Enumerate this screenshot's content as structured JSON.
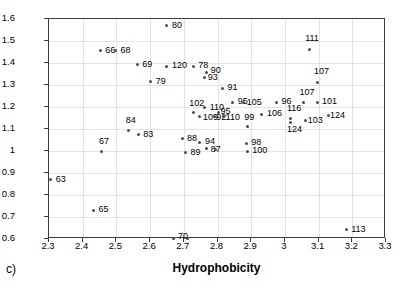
{
  "caption": "c)",
  "chart_data": {
    "type": "scatter",
    "title": "",
    "xlabel": "Hydrophobicity",
    "ylabel": "Silanol Activity at pH 7",
    "xlim": [
      2.3,
      3.3
    ],
    "ylim": [
      0.6,
      1.6
    ],
    "xticks": [
      "2.3",
      "2.4",
      "2.5",
      "2.6",
      "2.7",
      "2.8",
      "2.9",
      "3",
      "3.1",
      "3.2",
      "3.3"
    ],
    "yticks": [
      "0.6",
      "0.7",
      "0.8",
      "0.9",
      "1",
      "1.1",
      "1.2",
      "1.3",
      "1.4",
      "1.5",
      "1.6"
    ],
    "grid": true,
    "legend": "none",
    "marker": "small-dot",
    "points": [
      {
        "label": "63",
        "x": 2.305,
        "y": 0.87,
        "lx": 5,
        "ly": -5
      },
      {
        "label": "65",
        "x": 2.432,
        "y": 0.73,
        "lx": 5,
        "ly": -5
      },
      {
        "label": "66",
        "x": 2.452,
        "y": 1.455,
        "lx": 5,
        "ly": -5
      },
      {
        "label": "68",
        "x": 2.497,
        "y": 1.455,
        "lx": 5,
        "ly": -5
      },
      {
        "label": "67",
        "x": 2.457,
        "y": 1.0,
        "lx": -3,
        "ly": -14
      },
      {
        "label": "69",
        "x": 2.562,
        "y": 1.392,
        "lx": 5,
        "ly": -5
      },
      {
        "label": "79",
        "x": 2.602,
        "y": 1.315,
        "lx": 5,
        "ly": -5
      },
      {
        "label": "84",
        "x": 2.537,
        "y": 1.093,
        "lx": -3,
        "ly": -15
      },
      {
        "label": "83",
        "x": 2.565,
        "y": 1.073,
        "lx": 5,
        "ly": -5
      },
      {
        "label": "80",
        "x": 2.65,
        "y": 1.57,
        "lx": 5,
        "ly": -5
      },
      {
        "label": "120",
        "x": 2.65,
        "y": 1.385,
        "lx": 5,
        "ly": -5
      },
      {
        "label": "78",
        "x": 2.728,
        "y": 1.385,
        "lx": 5,
        "ly": -5
      },
      {
        "label": "70",
        "x": 2.668,
        "y": 0.602,
        "lx": 5,
        "ly": -7
      },
      {
        "label": "",
        "x": 2.712,
        "y": 0.602,
        "lx": 0,
        "ly": 0
      },
      {
        "label": "88",
        "x": 2.695,
        "y": 1.055,
        "lx": 5,
        "ly": -5
      },
      {
        "label": "89",
        "x": 2.705,
        "y": 0.993,
        "lx": 5,
        "ly": -5
      },
      {
        "label": "102",
        "x": 2.728,
        "y": 1.175,
        "lx": -4,
        "ly": -14
      },
      {
        "label": "109",
        "x": 2.748,
        "y": 1.155,
        "lx": 3,
        "ly": -4
      },
      {
        "label": "90",
        "x": 2.768,
        "y": 1.358,
        "lx": 4,
        "ly": -6
      },
      {
        "label": "93",
        "x": 2.762,
        "y": 1.335,
        "lx": 3,
        "ly": -4
      },
      {
        "label": "110",
        "x": 2.762,
        "y": 1.197,
        "lx": 5,
        "ly": -5
      },
      {
        "label": "94",
        "x": 2.748,
        "y": 1.04,
        "lx": 5,
        "ly": -5
      },
      {
        "label": "87",
        "x": 2.768,
        "y": 1.01,
        "lx": 4,
        "ly": -4
      },
      {
        "label": "",
        "x": 2.793,
        "y": 1.005,
        "lx": 0,
        "ly": 0
      },
      {
        "label": "92",
        "x": 2.79,
        "y": 1.155,
        "lx": 2,
        "ly": -4
      },
      {
        "label": "95",
        "x": 2.803,
        "y": 1.175,
        "lx": 2,
        "ly": -6
      },
      {
        "label": "110",
        "x": 2.818,
        "y": 1.155,
        "lx": 2,
        "ly": -4
      },
      {
        "label": "91",
        "x": 2.815,
        "y": 1.285,
        "lx": 5,
        "ly": -5
      },
      {
        "label": "95",
        "x": 2.845,
        "y": 1.222,
        "lx": 5,
        "ly": -5
      },
      {
        "label": "105",
        "x": 2.878,
        "y": 1.222,
        "lx": 3,
        "ly": -4
      },
      {
        "label": "99",
        "x": 2.888,
        "y": 1.11,
        "lx": -3,
        "ly": -14
      },
      {
        "label": "98",
        "x": 2.885,
        "y": 1.035,
        "lx": 5,
        "ly": -5
      },
      {
        "label": "100",
        "x": 2.888,
        "y": 0.998,
        "lx": 5,
        "ly": -5
      },
      {
        "label": "106",
        "x": 2.932,
        "y": 1.168,
        "lx": 5,
        "ly": -5
      },
      {
        "label": "96",
        "x": 2.975,
        "y": 1.222,
        "lx": 5,
        "ly": -5
      },
      {
        "label": "116",
        "x": 3.018,
        "y": 1.15,
        "lx": -4,
        "ly": -14
      },
      {
        "label": "124",
        "x": 3.018,
        "y": 1.128,
        "lx": -4,
        "ly": 2
      },
      {
        "label": "103",
        "x": 3.062,
        "y": 1.14,
        "lx": 2,
        "ly": -4
      },
      {
        "label": "107",
        "x": 3.055,
        "y": 1.222,
        "lx": -4,
        "ly": -14
      },
      {
        "label": "101",
        "x": 3.098,
        "y": 1.222,
        "lx": 4,
        "ly": -5
      },
      {
        "label": "124",
        "x": 3.128,
        "y": 1.16,
        "lx": 2,
        "ly": -5
      },
      {
        "label": "111",
        "x": 3.072,
        "y": 1.462,
        "lx": -4,
        "ly": -15
      },
      {
        "label": "107",
        "x": 3.098,
        "y": 1.312,
        "lx": -4,
        "ly": -15
      },
      {
        "label": "113",
        "x": 3.182,
        "y": 0.642,
        "lx": 5,
        "ly": -5
      }
    ]
  }
}
